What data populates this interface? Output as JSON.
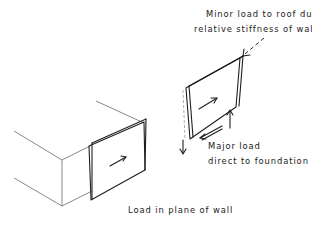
{
  "figure": {
    "caption": "Load in plane of wall",
    "annotations": {
      "minor_load_line1": "Minor load to roof due to",
      "minor_load_line2": "relative stiffness of wall",
      "major_load_line1": "Major load",
      "major_load_line2": "direct to foundation"
    },
    "elements": [
      {
        "name": "building-block",
        "description": "Isometric box representing building with wall panel on front face"
      },
      {
        "name": "building-wall-panel",
        "description": "Shear wall panel on building face with in-plane load arrow"
      },
      {
        "name": "detached-wall-panel",
        "description": "Exploded wall panel showing deformed (dashed) outline and load paths"
      },
      {
        "name": "roof-load-arrow",
        "description": "Dashed arrow indicating minor load to roof"
      },
      {
        "name": "foundation-shear-arrow",
        "description": "Arrow along base indicating load to foundation"
      },
      {
        "name": "uplift-arrow",
        "description": "Upward reaction arrow at right base"
      },
      {
        "name": "downward-arrow",
        "description": "Downward reaction arrow at left base"
      }
    ],
    "colors": {
      "ink": "#1f1f1f",
      "light_line": "#6a6a6a",
      "background": "#ffffff"
    }
  }
}
